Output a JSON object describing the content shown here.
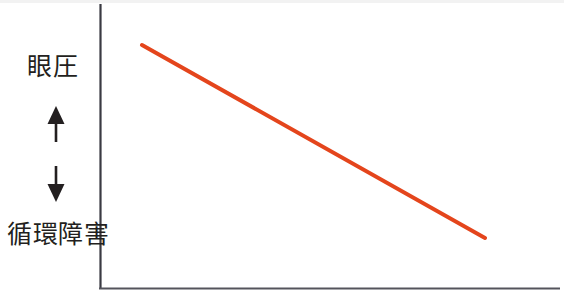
{
  "figure": {
    "background_color": "#ffffff",
    "axis_color": "#3a3a42",
    "label_color": "#231f20",
    "line_color": "#e4451c"
  },
  "labels": {
    "top": "眼圧",
    "bottom": "循環障害",
    "up_arrow": "up-arrow",
    "down_arrow": "down-arrow"
  },
  "chart_data": {
    "type": "line",
    "title": "",
    "xlabel": "",
    "ylabel": "眼圧 ↑ / 循環障害 ↓",
    "grid": false,
    "legend": "none",
    "axis_origin_px": [
      100,
      288
    ],
    "xlim": [
      0,
      100
    ],
    "ylim": [
      0,
      100
    ],
    "series": [
      {
        "name": "眼圧と循環障害の関係",
        "color": "#e4451c",
        "x": [
          9,
          84
        ],
        "y": [
          86,
          18
        ],
        "points_px": [
          [
            142,
            45
          ],
          [
            485,
            238
          ]
        ],
        "trend": "decreasing"
      }
    ],
    "annotations": [
      {
        "text": "眼圧",
        "position": "y-axis-top",
        "arrow": "up"
      },
      {
        "text": "循環障害",
        "position": "y-axis-bottom",
        "arrow": "down"
      }
    ],
    "xticks": [],
    "yticks": [],
    "xticklabels": [],
    "yticklabels": []
  }
}
